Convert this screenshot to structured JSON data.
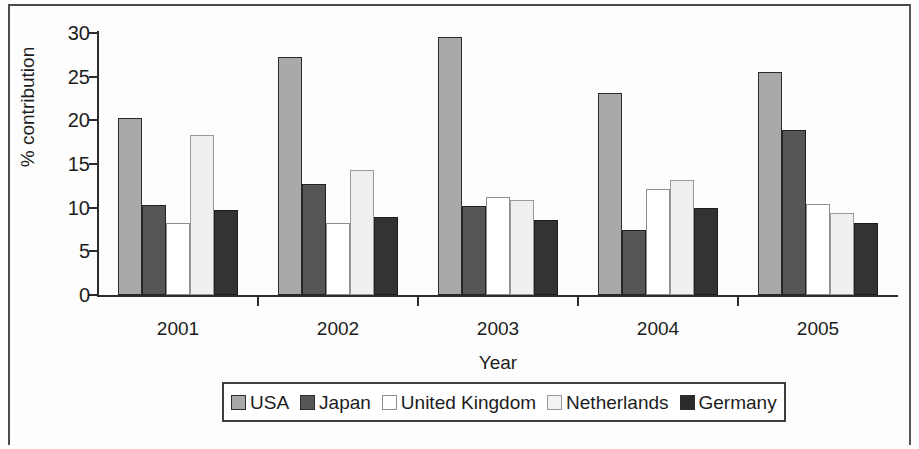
{
  "chart_data": {
    "type": "bar",
    "title": "",
    "xlabel": "Year",
    "ylabel": "% contribution",
    "categories": [
      "2001",
      "2002",
      "2003",
      "2004",
      "2005"
    ],
    "series": [
      {
        "name": "USA",
        "color": "#a9a9a9",
        "values": [
          20.3,
          27.3,
          29.5,
          23.1,
          25.5
        ]
      },
      {
        "name": "Japan",
        "color": "#565656",
        "values": [
          10.3,
          12.7,
          10.2,
          7.5,
          18.9
        ]
      },
      {
        "name": "United Kingdom",
        "color": "#ffffff",
        "values": [
          8.3,
          8.2,
          11.2,
          12.1,
          10.4
        ]
      },
      {
        "name": "Netherlands",
        "color": "#efefef",
        "values": [
          18.3,
          14.3,
          10.9,
          13.2,
          9.4
        ]
      },
      {
        "name": "Germany",
        "color": "#333333",
        "values": [
          9.7,
          8.9,
          8.6,
          10.0,
          8.3
        ]
      }
    ],
    "ylim": [
      0,
      30
    ],
    "ytick_values": [
      0,
      5,
      10,
      15,
      20,
      25,
      30
    ],
    "ytick_labels": [
      "0",
      "5",
      "10",
      "15",
      "20",
      "25",
      "30"
    ],
    "grid": false,
    "legend_position": "bottom"
  }
}
